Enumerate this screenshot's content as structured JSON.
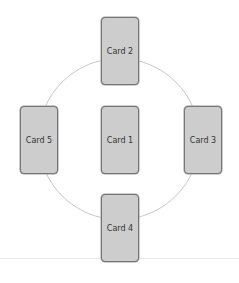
{
  "diagram": {
    "type": "cards-in-circle",
    "cards": [
      {
        "id": "card-1",
        "label": "Card 1",
        "position": "center"
      },
      {
        "id": "card-2",
        "label": "Card 2",
        "position": "top"
      },
      {
        "id": "card-3",
        "label": "Card 3",
        "position": "right"
      },
      {
        "id": "card-4",
        "label": "Card 4",
        "position": "bottom"
      },
      {
        "id": "card-5",
        "label": "Card 5",
        "position": "left"
      }
    ],
    "colors": {
      "card_fill": "#cdcdcd",
      "card_border": "#777777",
      "ring": "#c8c8c8",
      "text": "#333333"
    }
  }
}
